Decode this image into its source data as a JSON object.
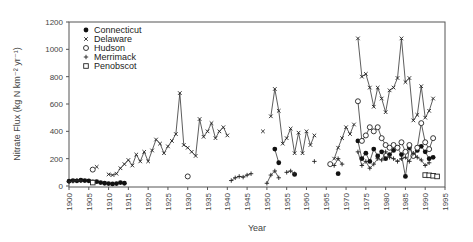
{
  "chart_data": {
    "type": "line",
    "title": "",
    "xlabel": "Year",
    "ylabel": "Nitrate Flux (kg N km⁻² yr⁻¹)",
    "xlim": [
      1900,
      1995
    ],
    "ylim": [
      0,
      1200
    ],
    "x_ticks": [
      "1900",
      "1905",
      "1910",
      "1915",
      "1920",
      "1925",
      "1930",
      "1935",
      "1940",
      "1945",
      "1950",
      "1955",
      "1960",
      "1965",
      "1970",
      "1975",
      "1980",
      "1985",
      "1990",
      "1995"
    ],
    "y_ticks": [
      "0",
      "200",
      "400",
      "600",
      "800",
      "1000",
      "1200"
    ],
    "grid": false,
    "legend_position": "upper-left",
    "series": [
      {
        "name": "Connecticut",
        "marker": "filled-circle",
        "segments": [
          [
            [
              1900,
              35
            ],
            [
              1901,
              40
            ],
            [
              1902,
              38
            ],
            [
              1903,
              42
            ],
            [
              1904,
              40
            ],
            [
              1905,
              38
            ]
          ],
          [
            [
              1906,
              30
            ],
            [
              1907,
              32
            ],
            [
              1908,
              25
            ],
            [
              1909,
              20
            ],
            [
              1910,
              18
            ],
            [
              1911,
              15
            ],
            [
              1912,
              18
            ],
            [
              1913,
              25
            ],
            [
              1914,
              20
            ]
          ],
          [
            [
              1952,
              270
            ],
            [
              1953,
              170
            ]
          ],
          [
            [
              1957,
              85
            ]
          ],
          [
            [
              1968,
              90
            ]
          ],
          [
            [
              1973,
              330
            ],
            [
              1974,
              200
            ],
            [
              1975,
              240
            ],
            [
              1976,
              180
            ],
            [
              1977,
              270
            ],
            [
              1978,
              220
            ],
            [
              1979,
              250
            ],
            [
              1980,
              200
            ],
            [
              1981,
              230
            ],
            [
              1982,
              260
            ],
            [
              1983,
              280
            ],
            [
              1984,
              230
            ],
            [
              1985,
              70
            ],
            [
              1986,
              280
            ],
            [
              1987,
              220
            ],
            [
              1988,
              260
            ],
            [
              1989,
              290
            ],
            [
              1990,
              250
            ],
            [
              1991,
              200
            ],
            [
              1992,
              210
            ]
          ]
        ]
      },
      {
        "name": "Delaware",
        "marker": "x",
        "segments": [
          [
            [
              1907,
              140
            ]
          ],
          [
            [
              1910,
              85
            ],
            [
              1911,
              80
            ],
            [
              1912,
              90
            ],
            [
              1913,
              130
            ],
            [
              1914,
              160
            ],
            [
              1915,
              190
            ],
            [
              1916,
              150
            ],
            [
              1917,
              230
            ],
            [
              1918,
              180
            ],
            [
              1919,
              250
            ],
            [
              1920,
              180
            ],
            [
              1921,
              260
            ],
            [
              1922,
              340
            ],
            [
              1923,
              310
            ],
            [
              1924,
              240
            ],
            [
              1925,
              290
            ],
            [
              1926,
              330
            ],
            [
              1927,
              380
            ],
            [
              1928,
              680
            ],
            [
              1929,
              300
            ],
            [
              1930,
              280
            ],
            [
              1931,
              250
            ],
            [
              1932,
              220
            ],
            [
              1933,
              490
            ],
            [
              1934,
              360
            ],
            [
              1935,
              400
            ],
            [
              1936,
              460
            ],
            [
              1937,
              350
            ],
            [
              1938,
              400
            ],
            [
              1939,
              430
            ],
            [
              1940,
              370
            ]
          ],
          [
            [
              1949,
              400
            ]
          ],
          [
            [
              1951,
              510
            ],
            [
              1952,
              710
            ],
            [
              1953,
              550
            ],
            [
              1954,
              310
            ],
            [
              1955,
              350
            ],
            [
              1956,
              420
            ],
            [
              1957,
              240
            ],
            [
              1958,
              390
            ],
            [
              1959,
              240
            ],
            [
              1960,
              400
            ],
            [
              1961,
              300
            ],
            [
              1962,
              370
            ]
          ],
          [
            [
              1967,
              200
            ],
            [
              1968,
              280
            ],
            [
              1969,
              350
            ],
            [
              1970,
              430
            ],
            [
              1971,
              380
            ],
            [
              1972,
              450
            ]
          ],
          [
            [
              1973,
              1080
            ],
            [
              1974,
              800
            ],
            [
              1975,
              820
            ],
            [
              1976,
              720
            ],
            [
              1977,
              580
            ],
            [
              1978,
              720
            ],
            [
              1979,
              640
            ],
            [
              1980,
              540
            ],
            [
              1981,
              700
            ],
            [
              1982,
              720
            ],
            [
              1983,
              790
            ],
            [
              1984,
              1080
            ],
            [
              1985,
              760
            ],
            [
              1986,
              790
            ],
            [
              1987,
              480
            ],
            [
              1988,
              520
            ],
            [
              1989,
              730
            ],
            [
              1990,
              500
            ],
            [
              1991,
              550
            ],
            [
              1992,
              640
            ]
          ]
        ]
      },
      {
        "name": "Hudson",
        "marker": "open-circle",
        "segments": [
          [
            [
              1906,
              120
            ]
          ],
          [
            [
              1930,
              70
            ]
          ],
          [
            [
              1966,
              160
            ]
          ],
          [
            [
              1973,
              620
            ],
            [
              1974,
              330
            ],
            [
              1975,
              370
            ],
            [
              1976,
              430
            ],
            [
              1977,
              400
            ],
            [
              1978,
              430
            ],
            [
              1979,
              350
            ],
            [
              1980,
              300
            ],
            [
              1981,
              280
            ],
            [
              1982,
              300
            ],
            [
              1983,
              280
            ],
            [
              1984,
              320
            ],
            [
              1985,
              250
            ],
            [
              1986,
              300
            ],
            [
              1987,
              220
            ],
            [
              1988,
              280
            ],
            [
              1989,
              460
            ],
            [
              1990,
              320
            ],
            [
              1991,
              270
            ],
            [
              1992,
              350
            ]
          ]
        ]
      },
      {
        "name": "Merrimack",
        "marker": "plus",
        "segments": [
          [
            [
              1900,
              30
            ],
            [
              1901,
              35
            ],
            [
              1902,
              40
            ],
            [
              1903,
              38
            ]
          ],
          [
            [
              1941,
              40
            ],
            [
              1942,
              60
            ],
            [
              1943,
              70
            ],
            [
              1944,
              65
            ],
            [
              1945,
              80
            ],
            [
              1946,
              90
            ]
          ],
          [
            [
              1950,
              20
            ],
            [
              1951,
              80
            ],
            [
              1952,
              110
            ],
            [
              1953,
              60
            ]
          ],
          [
            [
              1955,
              100
            ],
            [
              1956,
              110
            ],
            [
              1957,
              90
            ]
          ],
          [
            [
              1962,
              180
            ]
          ],
          [
            [
              1967,
              150
            ],
            [
              1968,
              200
            ],
            [
              1969,
              160
            ]
          ],
          [
            [
              1973,
              250
            ],
            [
              1974,
              150
            ],
            [
              1975,
              180
            ],
            [
              1976,
              130
            ],
            [
              1977,
              160
            ],
            [
              1978,
              200
            ],
            [
              1979,
              190
            ],
            [
              1980,
              250
            ],
            [
              1981,
              210
            ],
            [
              1982,
              200
            ],
            [
              1983,
              180
            ],
            [
              1984,
              200
            ],
            [
              1985,
              210
            ],
            [
              1986,
              180
            ],
            [
              1987,
              240
            ],
            [
              1988,
              210
            ],
            [
              1989,
              190
            ],
            [
              1990,
              150
            ],
            [
              1991,
              170
            ]
          ]
        ]
      },
      {
        "name": "Penobscot",
        "marker": "open-square",
        "segments": [
          [
            [
              1906,
              25
            ]
          ],
          [
            [
              1990,
              80
            ],
            [
              1991,
              78
            ],
            [
              1992,
              75
            ],
            [
              1993,
              70
            ]
          ]
        ]
      }
    ]
  }
}
